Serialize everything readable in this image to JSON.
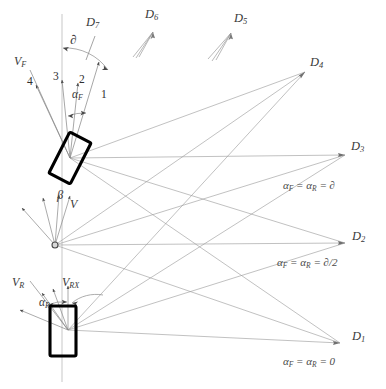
{
  "diagram": {
    "type": "technical-line-diagram",
    "background": "#ffffff",
    "colors": {
      "construction_line": "#9a9a9a",
      "vehicle_body": "#000000",
      "arrow": "#444444",
      "text": "#3a3a3a",
      "axis": "#a8a8a8"
    }
  },
  "centres": {
    "D1": {
      "label": "D",
      "subscript": "1",
      "x": 340,
      "y": 343,
      "note": "alpha_F = alpha_R = 0"
    },
    "D2": {
      "label": "D",
      "subscript": "2",
      "x": 345,
      "y": 243,
      "note": "alpha_F = alpha_R = d/2"
    },
    "D3": {
      "label": "D",
      "subscript": "3",
      "x": 345,
      "y": 155,
      "note": "alpha_F = alpha_R = d"
    },
    "D4": {
      "label": "D",
      "subscript": "4",
      "x": 305,
      "y": 72,
      "note": ""
    },
    "D5": {
      "label": "D",
      "subscript": "5",
      "x": 272,
      "y": 30,
      "note": ""
    },
    "D6": {
      "label": "D",
      "subscript": "6",
      "x": 152,
      "y": 25,
      "note": ""
    },
    "D7": {
      "label": "D",
      "subscript": "7",
      "x": 93,
      "y": 30,
      "note": ""
    }
  },
  "centre_labels": [
    {
      "name": "label-D7",
      "text": "D",
      "sub": "7",
      "x": 86,
      "y": 22
    },
    {
      "name": "label-D6",
      "text": "D",
      "sub": "6",
      "x": 145,
      "y": 14
    },
    {
      "name": "label-D5",
      "text": "D",
      "sub": "5",
      "x": 234,
      "y": 18
    },
    {
      "name": "label-D4",
      "text": "D",
      "sub": "4",
      "x": 310,
      "y": 62
    },
    {
      "name": "label-D3",
      "text": "D",
      "sub": "3",
      "x": 351,
      "y": 146
    },
    {
      "name": "label-D2",
      "text": "D",
      "sub": "2",
      "x": 352,
      "y": 236
    },
    {
      "name": "label-D1",
      "text": "D",
      "sub": "1",
      "x": 352,
      "y": 336
    }
  ],
  "equations": [
    {
      "name": "equation-D3",
      "text": "α",
      "sub1": "F",
      "mid": " = ",
      "text2": "α",
      "sub2": "R",
      "tail": " = ∂",
      "x": 283,
      "y": 186
    },
    {
      "name": "equation-D2",
      "text": "α",
      "sub1": "F",
      "mid": " = ",
      "text2": "α",
      "sub2": "R",
      "tail": " = ∂/2",
      "x": 277,
      "y": 263
    },
    {
      "name": "equation-D1",
      "text": "α",
      "sub1": "F",
      "mid": " = ",
      "text2": "α",
      "sub2": "R",
      "tail": " = 0",
      "x": 283,
      "y": 362
    }
  ],
  "equation_strings": {
    "d3": "αF = αR = ∂",
    "d2": "αF = αR = ∂/2",
    "d1": "αF = αR = 0"
  },
  "front_axle": {
    "name": "front-vehicle-body",
    "hub": {
      "x": 70,
      "y": 158
    },
    "rotation_deg": 27,
    "width": 24,
    "height": 46,
    "vector_label": {
      "text": "V",
      "sub": "F",
      "x": 16,
      "y": 60
    },
    "steer_angle_label": {
      "text": "α",
      "sub": "F",
      "x": 73,
      "y": 95
    },
    "delta_label": {
      "text": "∂",
      "x": 72,
      "y": 40
    },
    "ray_numbers": [
      {
        "name": "ray-label-4",
        "text": "4",
        "x": 27,
        "y": 82
      },
      {
        "name": "ray-label-3",
        "text": "3",
        "x": 53,
        "y": 77
      },
      {
        "name": "ray-label-2",
        "text": "2",
        "x": 79,
        "y": 80
      },
      {
        "name": "ray-label-1",
        "text": "1",
        "x": 101,
        "y": 95
      }
    ]
  },
  "centre_pivot": {
    "name": "body-centre-pivot",
    "x": 55,
    "y": 245,
    "beta_label": {
      "text": "β",
      "x": 58,
      "y": 195
    },
    "velocity_label": {
      "text": "V",
      "x": 70,
      "y": 203
    }
  },
  "rear_axle": {
    "name": "rear-vehicle-body",
    "hub": {
      "x": 68,
      "y": 330
    },
    "rotation_deg": 0,
    "width": 22,
    "height": 48,
    "vector_label": {
      "text": "V",
      "sub": "R",
      "x": 14,
      "y": 282
    },
    "vx_label": {
      "text": "V",
      "sub": "RX",
      "x": 62,
      "y": 282
    },
    "steer_angle_label": {
      "text": "α",
      "sub": "R",
      "x": 40,
      "y": 303
    }
  },
  "axes": {
    "vertical_centreline": {
      "x": 62,
      "y1": 12,
      "y2": 380
    },
    "horizontal_front": {
      "y": 158,
      "x1": 70,
      "x2": 345
    },
    "horizontal_centre": {
      "y": 245,
      "x1": 55,
      "x2": 345
    },
    "horizontal_rear": {
      "y": 330,
      "x1": 68,
      "x2": 340
    }
  }
}
